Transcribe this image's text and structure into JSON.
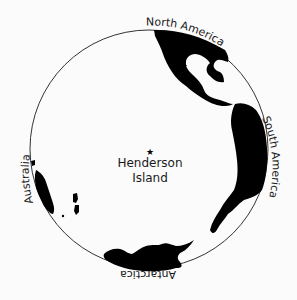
{
  "map": {
    "projection": "azimuthal view centered on Henderson Island",
    "center_label_line1": "Henderson",
    "center_label_line2": "Island",
    "center_marker": "star-icon",
    "continent_labels": {
      "north_america": "North America",
      "south_america": "South America",
      "australia": "Australia",
      "antarctica": "Antarctica"
    },
    "colors": {
      "land": "#000000",
      "ocean": "#fbfbfb",
      "outline": "#333333"
    }
  }
}
